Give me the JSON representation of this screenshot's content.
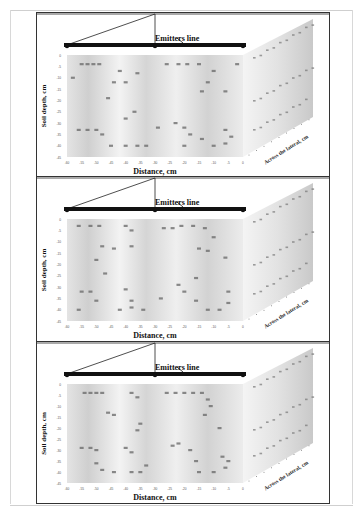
{
  "chart_data": [
    {
      "type": "scatter",
      "title": "Emitters line",
      "xlabel": "Distance, cm",
      "ylabel": "Soil depth, cm",
      "zlabel": "Across the lateral, cm",
      "xlim": [
        -60,
        0
      ],
      "ylim": [
        -45,
        0
      ],
      "xticks": [
        "-60",
        "-55",
        "-50",
        "-45",
        "-40",
        "-35",
        "-30",
        "-25",
        "-20",
        "-15",
        "-10",
        "-5",
        "0"
      ],
      "yticks": [
        "0",
        "-5",
        "-10",
        "-15",
        "-20",
        "-25",
        "-30",
        "-35",
        "-40",
        "-45"
      ],
      "emitters_x": [
        -60,
        -30,
        0
      ],
      "contour_label_points": [
        [
          -55,
          -4
        ],
        [
          -53,
          -4
        ],
        [
          -51,
          -4
        ],
        [
          -49,
          -4
        ],
        [
          -42,
          -7
        ],
        [
          -36,
          -8
        ],
        [
          -58,
          -10
        ],
        [
          -44,
          -12
        ],
        [
          -40,
          -12
        ],
        [
          -46,
          -19
        ],
        [
          -40,
          -28
        ],
        [
          -37,
          -25
        ],
        [
          -56,
          -33
        ],
        [
          -53,
          -33
        ],
        [
          -50,
          -33
        ],
        [
          -48,
          -35
        ],
        [
          -45,
          -40
        ],
        [
          -40,
          -40
        ],
        [
          -36,
          -40
        ],
        [
          -33,
          -40
        ],
        [
          -29,
          -32
        ],
        [
          -23,
          -30
        ],
        [
          -26,
          -4
        ],
        [
          -22,
          -4
        ],
        [
          -19,
          -4
        ],
        [
          -15,
          -4
        ],
        [
          -10,
          -7
        ],
        [
          -12,
          -12
        ],
        [
          -14,
          -16
        ],
        [
          -6,
          -16
        ],
        [
          -20,
          -32
        ],
        [
          -18,
          -35
        ],
        [
          -14,
          -37
        ],
        [
          -20,
          -40
        ],
        [
          -10,
          -40
        ],
        [
          -6,
          -39
        ],
        [
          -6,
          -33
        ],
        [
          -4,
          -36
        ],
        [
          -2,
          -4
        ]
      ]
    },
    {
      "type": "scatter",
      "title": "Emitters line",
      "xlabel": "Distance, cm",
      "ylabel": "Soil depth, cm",
      "zlabel": "Across the lateral, cm",
      "xlim": [
        -60,
        0
      ],
      "ylim": [
        -45,
        0
      ],
      "xticks": [
        "-60",
        "-55",
        "-50",
        "-45",
        "-40",
        "-35",
        "-30",
        "-25",
        "-20",
        "-15",
        "-10",
        "-5",
        "0"
      ],
      "yticks": [
        "0",
        "-5",
        "-10",
        "-15",
        "-20",
        "-25",
        "-30",
        "-35",
        "-40",
        "-45"
      ],
      "emitters_x": [
        -60,
        -30,
        0
      ],
      "contour_label_points": [
        [
          -56,
          -3
        ],
        [
          -52,
          -3
        ],
        [
          -49,
          -3
        ],
        [
          -40,
          -3
        ],
        [
          -38,
          -5
        ],
        [
          -48,
          -12
        ],
        [
          -44,
          -13
        ],
        [
          -38,
          -12
        ],
        [
          -50,
          -18
        ],
        [
          -47,
          -24
        ],
        [
          -55,
          -32
        ],
        [
          -52,
          -32
        ],
        [
          -50,
          -36
        ],
        [
          -40,
          -31
        ],
        [
          -38,
          -36
        ],
        [
          -42,
          -40
        ],
        [
          -38,
          -39
        ],
        [
          -34,
          -40
        ],
        [
          -27,
          -4
        ],
        [
          -24,
          -4
        ],
        [
          -21,
          -3
        ],
        [
          -17,
          -3
        ],
        [
          -13,
          -4
        ],
        [
          -10,
          -8
        ],
        [
          -15,
          -13
        ],
        [
          -12,
          -14
        ],
        [
          -6,
          -17
        ],
        [
          -16,
          -26
        ],
        [
          -22,
          -29
        ],
        [
          -20,
          -32
        ],
        [
          -16,
          -36
        ],
        [
          -12,
          -40
        ],
        [
          -8,
          -40
        ],
        [
          -5,
          -37
        ],
        [
          -5,
          -32
        ],
        [
          -28,
          -35
        ],
        [
          -56,
          -40
        ]
      ]
    },
    {
      "type": "scatter",
      "title": "Emitters line",
      "xlabel": "Distance, cm",
      "ylabel": "Soil depth, cm",
      "zlabel": "Across the lateral, cm",
      "xlim": [
        -60,
        0
      ],
      "ylim": [
        -45,
        0
      ],
      "xticks": [
        "-60",
        "-55",
        "-50",
        "-45",
        "-40",
        "-35",
        "-30",
        "-25",
        "-20",
        "-15",
        "-10",
        "-5",
        "0"
      ],
      "yticks": [
        "0",
        "-5",
        "-10",
        "-15",
        "-20",
        "-25",
        "-30",
        "-35",
        "-40",
        "-45"
      ],
      "emitters_x": [
        -60,
        -30,
        0
      ],
      "contour_label_points": [
        [
          -54,
          -4
        ],
        [
          -52,
          -4
        ],
        [
          -50,
          -4
        ],
        [
          -48,
          -4
        ],
        [
          -38,
          -4
        ],
        [
          -36,
          -6
        ],
        [
          -46,
          -13
        ],
        [
          -44,
          -14
        ],
        [
          -35,
          -18
        ],
        [
          -36,
          -21
        ],
        [
          -55,
          -29
        ],
        [
          -52,
          -29
        ],
        [
          -50,
          -30
        ],
        [
          -40,
          -29
        ],
        [
          -38,
          -31
        ],
        [
          -50,
          -36
        ],
        [
          -48,
          -39
        ],
        [
          -44,
          -40
        ],
        [
          -38,
          -40
        ],
        [
          -35,
          -40
        ],
        [
          -33,
          -37
        ],
        [
          -26,
          -4
        ],
        [
          -23,
          -4
        ],
        [
          -20,
          -4
        ],
        [
          -17,
          -4
        ],
        [
          -14,
          -4
        ],
        [
          -12,
          -7
        ],
        [
          -11,
          -10
        ],
        [
          -13,
          -14
        ],
        [
          -8,
          -20
        ],
        [
          -24,
          -28
        ],
        [
          -22,
          -27
        ],
        [
          -18,
          -30
        ],
        [
          -16,
          -35
        ],
        [
          -15,
          -40
        ],
        [
          -10,
          -40
        ],
        [
          -6,
          -38
        ],
        [
          -7,
          -33
        ],
        [
          -5,
          -35
        ]
      ]
    }
  ]
}
